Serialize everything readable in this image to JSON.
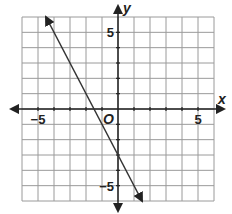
{
  "chart_data": {
    "type": "line",
    "title": "",
    "xlabel": "x",
    "ylabel": "y",
    "origin_label": "O",
    "xlim": [
      -6,
      6
    ],
    "ylim": [
      -6,
      6
    ],
    "grid": true,
    "grid_step": 1,
    "x_tick_labels": [
      {
        "value": -5,
        "label": "−5"
      },
      {
        "value": 5,
        "label": "5"
      }
    ],
    "y_tick_labels": [
      {
        "value": 5,
        "label": "5"
      },
      {
        "value": -5,
        "label": "−5"
      }
    ],
    "series": [
      {
        "name": "line",
        "equation": "y = -2x - 3",
        "slope": -2,
        "intercept": -3,
        "x": [
          -4.5,
          1.5
        ],
        "y": [
          6,
          -6
        ],
        "arrows_both_ends": true,
        "color": "#333333"
      }
    ],
    "legend": null
  },
  "colors": {
    "grid": "#9a9a9a",
    "axis": "#222222",
    "line": "#333333",
    "border": "#8a8a8a"
  }
}
